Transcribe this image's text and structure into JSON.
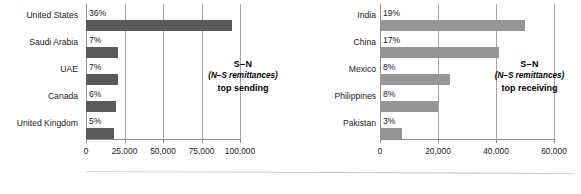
{
  "chart_data": [
    {
      "id": "top-sending",
      "type": "bar",
      "orientation": "horizontal",
      "title": "",
      "annotation": {
        "line1": "S–N",
        "line2": "(N–S remittances)",
        "line3": "top sending"
      },
      "categories": [
        "United States",
        "Saudi Arabia",
        "UAE",
        "Canada",
        "United Kingdom"
      ],
      "values": [
        95000,
        21000,
        21000,
        19500,
        18000
      ],
      "data_labels": [
        "36%",
        "7%",
        "7%",
        "6%",
        "5%"
      ],
      "xlabel": "",
      "ylabel": "",
      "xlim": [
        0,
        100000
      ],
      "xticks": [
        0,
        25000,
        50000,
        75000,
        100000
      ],
      "xtick_labels": [
        "0",
        "25,000",
        "50,000",
        "75,000",
        "100,000"
      ],
      "grid": true,
      "legend": "none",
      "bar_color": "#595959"
    },
    {
      "id": "top-receiving",
      "type": "bar",
      "orientation": "horizontal",
      "title": "",
      "annotation": {
        "line1": "S–N",
        "line2": "(N–S remittances)",
        "line3": "top receiving"
      },
      "categories": [
        "India",
        "China",
        "Mexico",
        "Philippines",
        "Pakistan"
      ],
      "values": [
        50000,
        41000,
        24000,
        20000,
        7500
      ],
      "data_labels": [
        "19%",
        "17%",
        "8%",
        "8%",
        "3%"
      ],
      "xlabel": "",
      "ylabel": "",
      "xlim": [
        0,
        60000
      ],
      "xticks": [
        0,
        20000,
        40000,
        60000
      ],
      "xtick_labels": [
        "0",
        "20,000",
        "40,000",
        "60,000"
      ],
      "grid": true,
      "legend": "none",
      "bar_color": "#969696"
    }
  ]
}
